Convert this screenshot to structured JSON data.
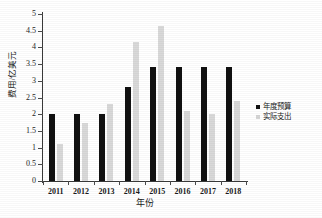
{
  "chart_data": {
    "type": "bar",
    "title": "",
    "subtitle": "",
    "xlabel": "年份",
    "ylabel": "费用/亿美元",
    "categories": [
      "2011",
      "2012",
      "2013",
      "2014",
      "2015",
      "2016",
      "2017",
      "2018"
    ],
    "series": [
      {
        "name": "年度预算",
        "color": "#111111",
        "values": [
          2.0,
          2.0,
          2.0,
          2.8,
          3.4,
          3.4,
          3.4,
          3.4
        ]
      },
      {
        "name": "实际支出",
        "color": "#d9d9d9",
        "values": [
          1.1,
          1.75,
          2.3,
          4.15,
          4.65,
          2.1,
          2.0,
          2.4
        ]
      }
    ],
    "ylim": [
      0,
      5
    ],
    "ytick_values": [
      0,
      0.5,
      1,
      1.5,
      2,
      2.5,
      3,
      3.5,
      4,
      4.5,
      5
    ],
    "ytick_labels": [
      "0",
      "0.5",
      "1",
      "1.5",
      "2",
      "2.5",
      "3",
      "3.5",
      "4",
      "4.5",
      "5"
    ],
    "grid": false,
    "legend_position": "right",
    "frame": "left-bottom-only"
  },
  "legend": {
    "entries": [
      {
        "label": "年度预算",
        "marker": "filled-square-black"
      },
      {
        "label": "实际支出",
        "marker": "filled-square-gray"
      }
    ]
  },
  "axes": {
    "y_title": "费用/亿美元",
    "x_title": "年份"
  },
  "colors": {
    "budget": "#111111",
    "actual": "#d9d9d9",
    "axis": "#3a3a3a",
    "text": "#1a1a1a",
    "background": "#ffffff"
  }
}
